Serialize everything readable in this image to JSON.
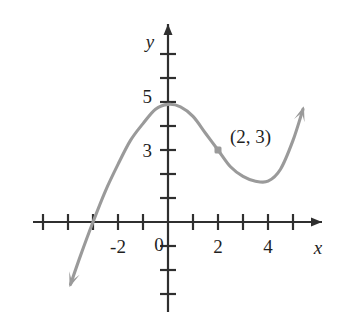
{
  "figure": {
    "title": "",
    "background_color": "#ffffff"
  },
  "axes": {
    "x_axis_label": "x",
    "y_axis_label": "y",
    "origin_label": "0",
    "axis_color": "#2f2f2f",
    "x_tick_labels": [
      "-2",
      "2",
      "4"
    ],
    "y_tick_labels": [
      "5",
      "3"
    ]
  },
  "annotations": {
    "point_label": "(2, 3)"
  },
  "chart_data": {
    "type": "line",
    "title": "",
    "xlabel": "x",
    "ylabel": "y",
    "curve_color": "#9a9a9a",
    "grid": false,
    "legend": null,
    "xlim": [
      -5,
      6
    ],
    "ylim": [
      -4,
      7
    ],
    "x_ticks": [
      -5,
      -4,
      -3,
      -2,
      -1,
      0,
      1,
      2,
      3,
      4,
      5,
      6
    ],
    "x_ticks_labeled": [
      {
        "value": -2,
        "label": "-2"
      },
      {
        "value": 0,
        "label": "0"
      },
      {
        "value": 2,
        "label": "2"
      },
      {
        "value": 4,
        "label": "4"
      }
    ],
    "y_ticks": [
      -3,
      -2,
      -1,
      1,
      2,
      3,
      4,
      5,
      6,
      7
    ],
    "y_ticks_labeled": [
      {
        "value": 5,
        "label": "5"
      },
      {
        "value": 3,
        "label": "3"
      }
    ],
    "series": [
      {
        "name": "curve",
        "style": "smooth cubic with arrowheads at both ends",
        "x": [
          -3.9,
          -3.5,
          -3.0,
          -2.5,
          -2.0,
          -1.5,
          -1.0,
          -0.5,
          0.0,
          0.5,
          1.0,
          1.5,
          2.0,
          2.5,
          3.0,
          3.5,
          4.0,
          4.5,
          5.0,
          5.4
        ],
        "y": [
          -2.6,
          -1.4,
          0.0,
          1.3,
          2.4,
          3.4,
          4.1,
          4.7,
          4.9,
          4.8,
          4.4,
          3.7,
          3.0,
          2.3,
          1.9,
          1.7,
          1.7,
          2.2,
          3.4,
          4.7
        ]
      }
    ],
    "annotations": [
      {
        "label": "(2, 3)",
        "x": 2,
        "y": 3,
        "marker": true,
        "marker_color": "#9a9a9a"
      }
    ],
    "x_intercepts": [
      -3.0
    ],
    "local_maximum": {
      "x": 0.0,
      "y": 4.9
    },
    "local_minimum": {
      "x": 4.1,
      "y": 1.7
    }
  }
}
